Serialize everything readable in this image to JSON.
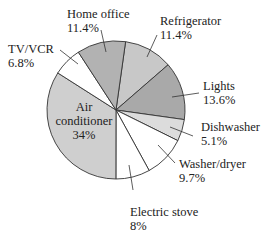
{
  "chart_data": {
    "type": "pie",
    "title": "",
    "center": [
      116,
      110
    ],
    "radius": 69,
    "start_angle_deg": 8,
    "direction": "clockwise",
    "slices": [
      {
        "label": "Refrigerator",
        "value": 11.4,
        "value_label": "11.4%",
        "color": "#c8c8c8"
      },
      {
        "label": "Lights",
        "value": 13.6,
        "value_label": "13.6%",
        "color": "#a9a9a9"
      },
      {
        "label": "Dishwasher",
        "value": 5.1,
        "value_label": "5.1%",
        "color": "#dcdcdc"
      },
      {
        "label": "Washer/dryer",
        "value": 9.7,
        "value_label": "9.7%",
        "color": "#ffffff"
      },
      {
        "label": "Electric stove",
        "value": 8,
        "value_label": "8%",
        "color": "#ffffff"
      },
      {
        "label": "Air conditioner",
        "value": 34,
        "value_label": "34%",
        "color": "#cfcfcf"
      },
      {
        "label": "TV/VCR",
        "value": 6.8,
        "value_label": "6.8%",
        "color": "#ffffff"
      },
      {
        "label": "Home office",
        "value": 11.4,
        "value_label": "11.4%",
        "color": "#b2b2b2"
      }
    ],
    "categories": [
      "Refrigerator",
      "Lights",
      "Dishwasher",
      "Washer/dryer",
      "Electric stove",
      "Air conditioner",
      "TV/VCR",
      "Home office"
    ],
    "values": [
      11.4,
      13.6,
      5.1,
      9.7,
      8,
      34,
      6.8,
      11.4
    ],
    "unit": "%"
  },
  "labels": {
    "home_office": {
      "name": "Home office",
      "pct": "11.4%"
    },
    "refrigerator": {
      "name": "Refrigerator",
      "pct": "11.4%"
    },
    "tv_vcr": {
      "name": "TV/VCR",
      "pct": "6.8%"
    },
    "lights": {
      "name": "Lights",
      "pct": "13.6%"
    },
    "air_conditioner": {
      "name1": "Air",
      "name2": "conditioner",
      "pct": "34%"
    },
    "dishwasher": {
      "name": "Dishwasher",
      "pct": "5.1%"
    },
    "washer_dryer": {
      "name": "Washer/dryer",
      "pct": "9.7%"
    },
    "electric_stove": {
      "name": "Electric stove",
      "pct": "8%"
    }
  }
}
